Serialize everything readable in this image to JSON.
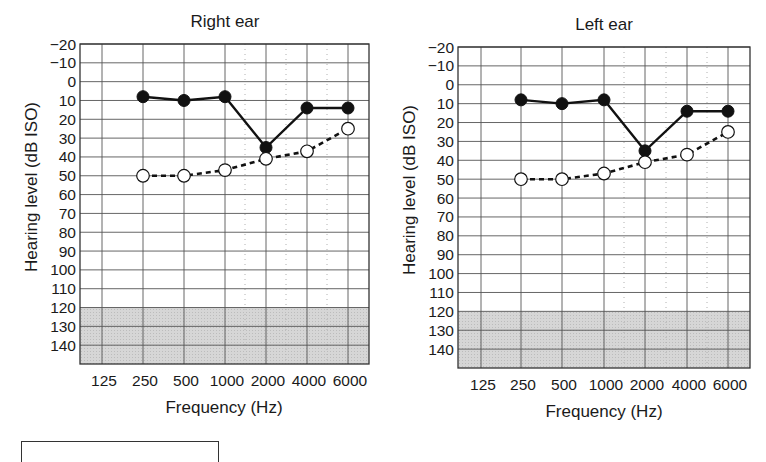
{
  "chart_data": [
    {
      "type": "line",
      "title": "Right ear",
      "xlabel": "Frequency (Hz)",
      "ylabel": "Hearing level (dB ISO)",
      "categories": [
        "125",
        "250",
        "500",
        "1000",
        "2000",
        "4000",
        "6000"
      ],
      "y_ticks": [
        -20,
        -10,
        0,
        10,
        20,
        30,
        40,
        50,
        60,
        70,
        80,
        90,
        100,
        110,
        120,
        130,
        140
      ],
      "ylim": [
        -20,
        150
      ],
      "y_inverted": true,
      "grid": true,
      "shaded_region": {
        "from": 120,
        "to": 150,
        "color": "#d6d6d6"
      },
      "series": [
        {
          "name": "Air conduction (filled)",
          "marker": "filled-circle",
          "line": "solid",
          "x": [
            "250",
            "500",
            "1000",
            "2000",
            "4000",
            "6000"
          ],
          "values": [
            8,
            10,
            8,
            35,
            14,
            14
          ]
        },
        {
          "name": "Open circles (dashed)",
          "marker": "open-circle",
          "line": "dashed",
          "x": [
            "250",
            "500",
            "1000",
            "2000",
            "4000",
            "6000"
          ],
          "values": [
            50,
            50,
            47,
            41,
            37,
            25
          ]
        }
      ]
    },
    {
      "type": "line",
      "title": "Left ear",
      "xlabel": "Frequency (Hz)",
      "ylabel": "Hearing level (dB ISO)",
      "categories": [
        "125",
        "250",
        "500",
        "1000",
        "2000",
        "4000",
        "6000"
      ],
      "y_ticks": [
        -20,
        -10,
        0,
        10,
        20,
        30,
        40,
        50,
        60,
        70,
        80,
        90,
        100,
        110,
        120,
        130,
        140
      ],
      "ylim": [
        -20,
        150
      ],
      "y_inverted": true,
      "grid": true,
      "shaded_region": {
        "from": 120,
        "to": 150,
        "color": "#d6d6d6"
      },
      "series": [
        {
          "name": "Air conduction (filled)",
          "marker": "filled-circle",
          "line": "solid",
          "x": [
            "250",
            "500",
            "1000",
            "2000",
            "4000",
            "6000"
          ],
          "values": [
            8,
            10,
            8,
            35,
            14,
            14
          ]
        },
        {
          "name": "Open circles (dashed)",
          "marker": "open-circle",
          "line": "dashed",
          "x": [
            "250",
            "500",
            "1000",
            "2000",
            "4000",
            "6000"
          ],
          "values": [
            50,
            50,
            47,
            41,
            37,
            25
          ]
        }
      ]
    }
  ]
}
